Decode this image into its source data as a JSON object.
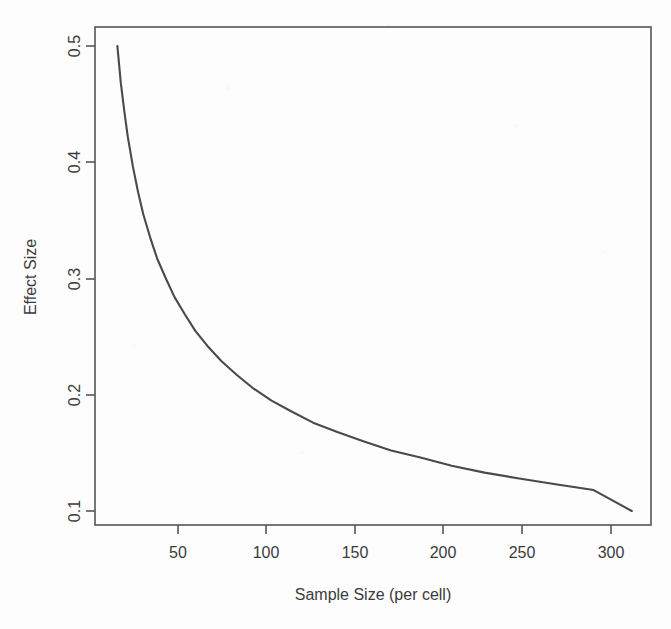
{
  "figure": {
    "background_color": "#fdfdfd",
    "line_color": "#4a4a4d",
    "axis_color": "#555558",
    "text_color": "#3b3b3b",
    "top_caption": ""
  },
  "chart_data": {
    "type": "line",
    "title": "",
    "xlabel": "Sample Size (per cell)",
    "ylabel": "Effect Size",
    "xlim": [
      11,
      320
    ],
    "ylim": [
      0.092,
      0.515
    ],
    "xticks": [
      50,
      100,
      150,
      200,
      250,
      300
    ],
    "xtick_labels": [
      "50",
      "100",
      "150",
      "200",
      "250",
      "300"
    ],
    "yticks": [
      0.1,
      0.2,
      0.3,
      0.4,
      0.5
    ],
    "ytick_labels": [
      "0.1",
      "0.2",
      "0.3",
      "0.4",
      "0.5"
    ],
    "grid": false,
    "legend": "none",
    "series": [
      {
        "name": "Minimum detectable effect size",
        "x": [
          15,
          17,
          19,
          21,
          24,
          27,
          30,
          34,
          38,
          43,
          48,
          54,
          60,
          67,
          75,
          84,
          93,
          104,
          115,
          128,
          142,
          157,
          173,
          190,
          208,
          227,
          247,
          268,
          290,
          312
        ],
        "y": [
          0.5,
          0.468,
          0.444,
          0.422,
          0.396,
          0.374,
          0.355,
          0.335,
          0.317,
          0.3,
          0.284,
          0.269,
          0.255,
          0.242,
          0.229,
          0.217,
          0.206,
          0.195,
          0.186,
          0.176,
          0.168,
          0.16,
          0.152,
          0.146,
          0.139,
          0.133,
          0.128,
          0.123,
          0.118,
          0.1
        ]
      }
    ],
    "annotations": []
  },
  "axes": {
    "x_axis_title": "Sample Size (per cell)",
    "y_axis_title": "Effect Size"
  }
}
